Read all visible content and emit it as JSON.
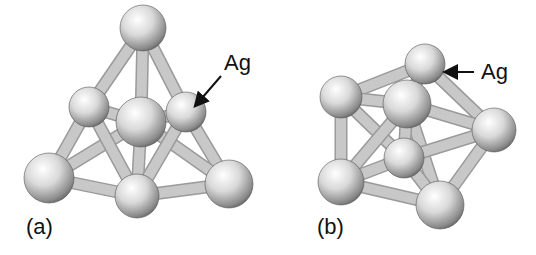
{
  "figure": {
    "panels": [
      {
        "id": "a",
        "caption": "(a)",
        "annotation": "Ag",
        "atoms": [
          {
            "x": 143,
            "y": 28,
            "r": 23
          },
          {
            "x": 89,
            "y": 107,
            "r": 20
          },
          {
            "x": 186,
            "y": 112,
            "r": 20
          },
          {
            "x": 141,
            "y": 122,
            "r": 25
          },
          {
            "x": 49,
            "y": 178,
            "r": 25
          },
          {
            "x": 137,
            "y": 196,
            "r": 22
          },
          {
            "x": 229,
            "y": 184,
            "r": 24
          }
        ],
        "bonds": [
          [
            0,
            1
          ],
          [
            0,
            2
          ],
          [
            0,
            3
          ],
          [
            1,
            3
          ],
          [
            2,
            3
          ],
          [
            1,
            4
          ],
          [
            2,
            6
          ],
          [
            3,
            4
          ],
          [
            3,
            5
          ],
          [
            3,
            6
          ],
          [
            4,
            5
          ],
          [
            5,
            6
          ],
          [
            1,
            5
          ],
          [
            2,
            5
          ]
        ]
      },
      {
        "id": "b",
        "caption": "(b)",
        "annotation": "Ag",
        "atoms": [
          {
            "x": 425,
            "y": 64,
            "r": 20
          },
          {
            "x": 341,
            "y": 97,
            "r": 21
          },
          {
            "x": 494,
            "y": 130,
            "r": 22
          },
          {
            "x": 404,
            "y": 158,
            "r": 20
          },
          {
            "x": 407,
            "y": 104,
            "r": 24
          },
          {
            "x": 341,
            "y": 182,
            "r": 23
          },
          {
            "x": 440,
            "y": 205,
            "r": 24
          }
        ],
        "bonds": [
          [
            0,
            1
          ],
          [
            0,
            4
          ],
          [
            0,
            2
          ],
          [
            1,
            4
          ],
          [
            4,
            2
          ],
          [
            1,
            5
          ],
          [
            1,
            3
          ],
          [
            4,
            5
          ],
          [
            4,
            6
          ],
          [
            4,
            3
          ],
          [
            2,
            6
          ],
          [
            2,
            3
          ],
          [
            5,
            6
          ],
          [
            5,
            3
          ],
          [
            3,
            6
          ]
        ]
      }
    ]
  }
}
